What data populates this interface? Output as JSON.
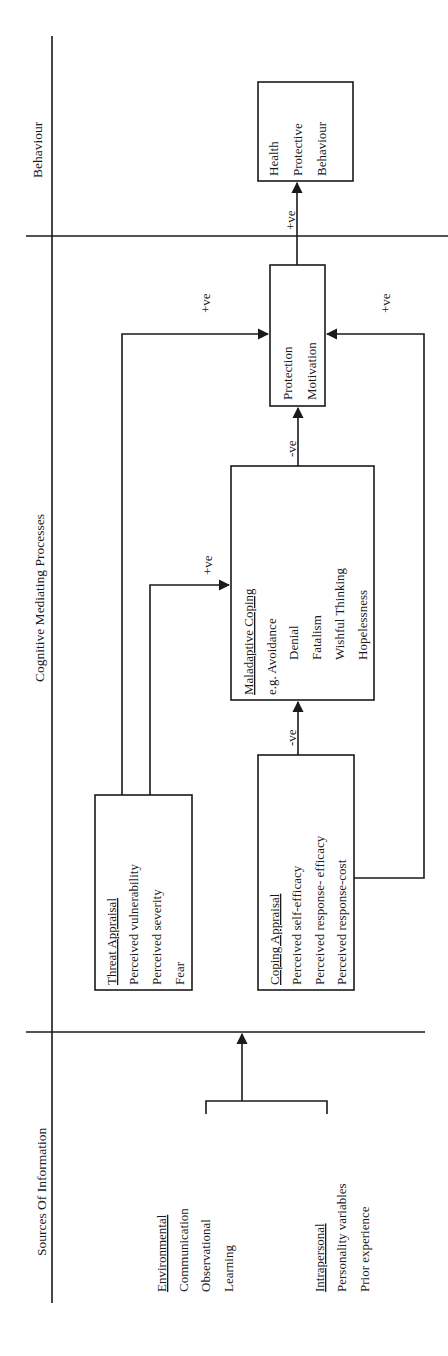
{
  "diagram": {
    "orientation": "rotated-90-ccw",
    "columns": {
      "behaviour": "Behaviour",
      "cognitive": "Cognitive Mediating Processes",
      "sources": "Sources Of Information"
    },
    "sources": {
      "environmental": {
        "heading": "Environmental",
        "items": [
          "Communication",
          "Observational",
          "Learning"
        ]
      },
      "intrapersonal": {
        "heading": "Intrapersonal",
        "items": [
          "Personality variables",
          "Prior experience"
        ]
      }
    },
    "threat_appraisal": {
      "heading": "Threat Appraisal",
      "items": [
        "Perceived vulnerability",
        "Perceived severity",
        "Fear"
      ]
    },
    "coping_appraisal": {
      "heading": "Coping Appraisal",
      "items": [
        "Perceived self-efficacy",
        "Perceived response- efficacy",
        "Perceived response-cost"
      ]
    },
    "maladaptive_coping": {
      "heading": "Maladaptive Coping",
      "items": [
        "e.g. Avoidance",
        "Denial",
        "Fatalism",
        "Wishful Thinking",
        "Hopelessness"
      ]
    },
    "protection_motivation": {
      "lines": [
        "Protection",
        "Motivation"
      ]
    },
    "health_behaviour": {
      "lines": [
        "Health",
        "Protective",
        "Behaviour"
      ]
    },
    "edges": {
      "threat_to_pm": "+ve",
      "threat_to_maladaptive": "+ve",
      "coping_to_maladaptive": "-ve",
      "maladaptive_to_pm": "-ve",
      "coping_to_pm": "+ve",
      "pm_to_behaviour": "+ve"
    }
  }
}
